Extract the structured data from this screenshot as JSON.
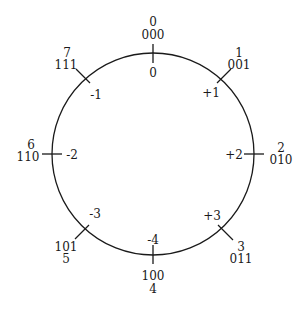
{
  "diagram": {
    "type": "circular number wheel (3-bit two's complement)",
    "circle": {
      "cx": 153,
      "cy": 154,
      "r": 101,
      "stroke": "#1a1a1a"
    },
    "positions": [
      {
        "unsigned": "0",
        "bits": "000",
        "signed": "0"
      },
      {
        "unsigned": "1",
        "bits": "001",
        "signed": "+1"
      },
      {
        "unsigned": "2",
        "bits": "010",
        "signed": "+2"
      },
      {
        "unsigned": "3",
        "bits": "011",
        "signed": "+3"
      },
      {
        "unsigned": "4",
        "bits": "100",
        "signed": "-4"
      },
      {
        "unsigned": "5",
        "bits": "101",
        "signed": "-3"
      },
      {
        "unsigned": "6",
        "bits": "110",
        "signed": "-2"
      },
      {
        "unsigned": "7",
        "bits": "111",
        "signed": "-1"
      }
    ]
  }
}
